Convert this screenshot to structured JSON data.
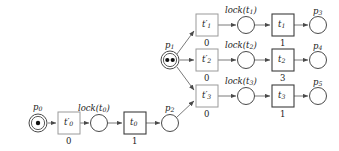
{
  "diagram": {
    "type": "petri-net",
    "title": "",
    "colors": {
      "background": "#ffffff",
      "place_stroke": "#4a4a4a",
      "token_fill": "#111111",
      "lock_transition_stroke": "#9a9a9a",
      "timed_transition_stroke": "#3d3d3d",
      "arc_stroke": "#6b6b6b",
      "text": "#1a1a1a"
    },
    "places": [
      {
        "id": "p0",
        "label": "p",
        "sub": "0",
        "tokens": 1,
        "double_ring": true,
        "cx": 38,
        "cy": 123,
        "r": 9,
        "label_x": 33,
        "label_y": 103
      },
      {
        "id": "p1",
        "label": "p",
        "sub": "1",
        "tokens": 2,
        "double_ring": true,
        "cx": 170,
        "cy": 60,
        "r": 9,
        "label_x": 165,
        "label_y": 41
      },
      {
        "id": "p2",
        "label": "p",
        "sub": "2",
        "tokens": 0,
        "double_ring": false,
        "cx": 170,
        "cy": 123,
        "r": 8.5,
        "label_x": 165,
        "label_y": 104
      },
      {
        "id": "p3",
        "label": "p",
        "sub": "3",
        "tokens": 0,
        "double_ring": false,
        "cx": 318,
        "cy": 25,
        "r": 8.5,
        "label_x": 313,
        "label_y": 7
      },
      {
        "id": "p4",
        "label": "p",
        "sub": "4",
        "tokens": 0,
        "double_ring": false,
        "cx": 318,
        "cy": 60,
        "r": 8.5,
        "label_x": 313,
        "label_y": 42
      },
      {
        "id": "p5",
        "label": "p",
        "sub": "5",
        "tokens": 0,
        "double_ring": false,
        "cx": 318,
        "cy": 96,
        "r": 8.5,
        "label_x": 313,
        "label_y": 78
      },
      {
        "id": "lock_t0",
        "label": "",
        "sub": "",
        "tokens": 0,
        "double_ring": false,
        "cx": 99,
        "cy": 123,
        "r": 8.5,
        "label_x": 0,
        "label_y": 0
      },
      {
        "id": "lock_t1",
        "label": "",
        "sub": "",
        "tokens": 0,
        "double_ring": false,
        "cx": 246,
        "cy": 25,
        "r": 8.5,
        "label_x": 0,
        "label_y": 0
      },
      {
        "id": "lock_t2",
        "label": "",
        "sub": "",
        "tokens": 0,
        "double_ring": false,
        "cx": 246,
        "cy": 60,
        "r": 8.5,
        "label_x": 0,
        "label_y": 0
      },
      {
        "id": "lock_t3",
        "label": "",
        "sub": "",
        "tokens": 0,
        "double_ring": false,
        "cx": 246,
        "cy": 96,
        "r": 8.5,
        "label_x": 0,
        "label_y": 0
      }
    ],
    "lock_labels": [
      {
        "id": "lock_t0_label",
        "text": "lock(t",
        "sub": "0",
        "tail": ")",
        "x": 78,
        "y": 104
      },
      {
        "id": "lock_t1_label",
        "text": "lock(t",
        "sub": "1",
        "tail": ")",
        "x": 225,
        "y": 6
      },
      {
        "id": "lock_t2_label",
        "text": "lock(t",
        "sub": "2",
        "tail": ")",
        "x": 225,
        "y": 41
      },
      {
        "id": "lock_t3_label",
        "text": "lock(t",
        "sub": "3",
        "tail": ")",
        "x": 225,
        "y": 77
      }
    ],
    "transitions": [
      {
        "id": "tp0",
        "label": "t",
        "sub": "0",
        "prime": true,
        "weight": "0",
        "kind": "lock",
        "x": 58,
        "y": 112,
        "w": 22,
        "h": 22,
        "weight_x": 66,
        "weight_y": 137
      },
      {
        "id": "t0",
        "label": "t",
        "sub": "0",
        "prime": false,
        "weight": "1",
        "kind": "timed",
        "x": 124,
        "y": 112,
        "w": 22,
        "h": 22,
        "weight_x": 132,
        "weight_y": 137
      },
      {
        "id": "tp1",
        "label": "t",
        "sub": "1",
        "prime": true,
        "weight": "0",
        "kind": "lock",
        "x": 196,
        "y": 14,
        "w": 22,
        "h": 22,
        "weight_x": 204,
        "weight_y": 39
      },
      {
        "id": "t1",
        "label": "t",
        "sub": "1",
        "prime": false,
        "weight": "1",
        "kind": "timed",
        "x": 272,
        "y": 14,
        "w": 22,
        "h": 22,
        "weight_x": 280,
        "weight_y": 39
      },
      {
        "id": "tp2",
        "label": "t",
        "sub": "2",
        "prime": true,
        "weight": "0",
        "kind": "lock",
        "x": 196,
        "y": 49,
        "w": 22,
        "h": 22,
        "weight_x": 204,
        "weight_y": 74
      },
      {
        "id": "t2",
        "label": "t",
        "sub": "2",
        "prime": false,
        "weight": "3",
        "kind": "timed",
        "x": 272,
        "y": 49,
        "w": 22,
        "h": 22,
        "weight_x": 280,
        "weight_y": 74
      },
      {
        "id": "tp3",
        "label": "t",
        "sub": "3",
        "prime": true,
        "weight": "0",
        "kind": "lock",
        "x": 196,
        "y": 85,
        "w": 22,
        "h": 22,
        "weight_x": 204,
        "weight_y": 110
      },
      {
        "id": "t3",
        "label": "t",
        "sub": "3",
        "prime": false,
        "weight": "1",
        "kind": "timed",
        "x": 272,
        "y": 85,
        "w": 22,
        "h": 22,
        "weight_x": 280,
        "weight_y": 110
      }
    ],
    "arcs": [
      {
        "id": "arc-p0-tp0",
        "from": "p0",
        "to": "tp0",
        "x1": 48,
        "y1": 123,
        "x2": 56,
        "y2": 123
      },
      {
        "id": "arc-tp0-lock0",
        "from": "tp0",
        "to": "lock_t0",
        "x1": 80,
        "y1": 123,
        "x2": 89,
        "y2": 123
      },
      {
        "id": "arc-lock0-t0",
        "from": "lock_t0",
        "to": "t0",
        "x1": 108,
        "y1": 123,
        "x2": 122,
        "y2": 123
      },
      {
        "id": "arc-t0-p2",
        "from": "t0",
        "to": "p2",
        "x1": 146,
        "y1": 123,
        "x2": 160,
        "y2": 123
      },
      {
        "id": "arc-p1-tp1",
        "from": "p1",
        "to": "tp1",
        "x1": 177,
        "y1": 54,
        "x2": 194,
        "y2": 31
      },
      {
        "id": "arc-p1-tp2",
        "from": "p1",
        "to": "tp2",
        "x1": 180,
        "y1": 60,
        "x2": 194,
        "y2": 60
      },
      {
        "id": "arc-p1-tp3",
        "from": "p1",
        "to": "tp3",
        "x1": 177,
        "y1": 67,
        "x2": 194,
        "y2": 90
      },
      {
        "id": "arc-p2-tp3",
        "from": "p2",
        "to": "tp3",
        "x1": 177,
        "y1": 117,
        "x2": 194,
        "y2": 101
      },
      {
        "id": "arc-tp1-lock1",
        "from": "tp1",
        "to": "lock_t1",
        "x1": 218,
        "y1": 25,
        "x2": 236,
        "y2": 25
      },
      {
        "id": "arc-lock1-t1",
        "from": "lock_t1",
        "to": "t1",
        "x1": 255,
        "y1": 25,
        "x2": 270,
        "y2": 25
      },
      {
        "id": "arc-t1-p3",
        "from": "t1",
        "to": "p3",
        "x1": 294,
        "y1": 25,
        "x2": 308,
        "y2": 25
      },
      {
        "id": "arc-tp2-lock2",
        "from": "tp2",
        "to": "lock_t2",
        "x1": 218,
        "y1": 60,
        "x2": 236,
        "y2": 60
      },
      {
        "id": "arc-lock2-t2",
        "from": "lock_t2",
        "to": "t2",
        "x1": 255,
        "y1": 60,
        "x2": 270,
        "y2": 60
      },
      {
        "id": "arc-t2-p4",
        "from": "t2",
        "to": "p4",
        "x1": 294,
        "y1": 60,
        "x2": 308,
        "y2": 60
      },
      {
        "id": "arc-tp3-lock3",
        "from": "tp3",
        "to": "lock_t3",
        "x1": 218,
        "y1": 96,
        "x2": 236,
        "y2": 96
      },
      {
        "id": "arc-lock3-t3",
        "from": "lock_t3",
        "to": "t3",
        "x1": 255,
        "y1": 96,
        "x2": 270,
        "y2": 96
      },
      {
        "id": "arc-t3-p5",
        "from": "t3",
        "to": "p5",
        "x1": 294,
        "y1": 96,
        "x2": 308,
        "y2": 96
      }
    ]
  }
}
